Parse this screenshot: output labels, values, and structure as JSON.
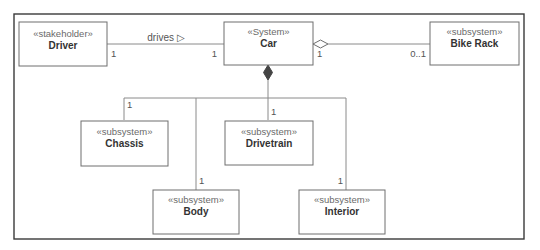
{
  "diagram": {
    "type": "SysML block definition diagram",
    "blocks": [
      {
        "id": "driver",
        "stereotype": "«stakeholder»",
        "name": "Driver"
      },
      {
        "id": "car",
        "stereotype": "«System»",
        "name": "Car"
      },
      {
        "id": "bike_rack",
        "stereotype": "«subsystem»",
        "name": "Bike Rack"
      },
      {
        "id": "chassis",
        "stereotype": "«subsystem»",
        "name": "Chassis"
      },
      {
        "id": "drivetrain",
        "stereotype": "«subsystem»",
        "name": "Drivetrain"
      },
      {
        "id": "body",
        "stereotype": "«subsystem»",
        "name": "Body"
      },
      {
        "id": "interior",
        "stereotype": "«subsystem»",
        "name": "Interior"
      }
    ],
    "relationships": [
      {
        "id": "drives",
        "kind": "association",
        "from": "driver",
        "to": "car",
        "label": "drives ▷",
        "from_mult": "1",
        "to_mult": "1"
      },
      {
        "id": "bike_rack_agg",
        "kind": "aggregation",
        "whole": "car",
        "part": "bike_rack",
        "whole_mult": "1",
        "part_mult": "0..1"
      },
      {
        "id": "comp_chassis",
        "kind": "composition",
        "whole": "car",
        "part": "chassis",
        "part_mult": "1"
      },
      {
        "id": "comp_drivetrain",
        "kind": "composition",
        "whole": "car",
        "part": "drivetrain",
        "part_mult": "1"
      },
      {
        "id": "comp_body",
        "kind": "composition",
        "whole": "car",
        "part": "body",
        "part_mult": "1"
      },
      {
        "id": "comp_interior",
        "kind": "composition",
        "whole": "car",
        "part": "interior",
        "part_mult": "1"
      }
    ]
  }
}
